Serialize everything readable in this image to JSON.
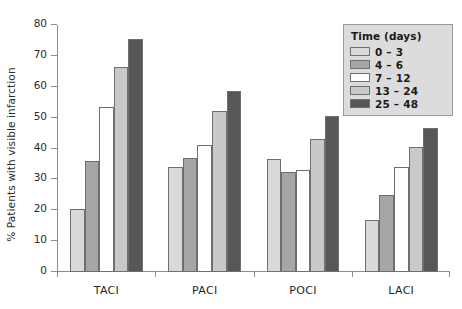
{
  "chart_data": {
    "type": "bar",
    "title": "",
    "xlabel": "",
    "ylabel": "% Patients with visible infarction",
    "ylim": [
      0,
      80
    ],
    "yticks": [
      0,
      10,
      20,
      30,
      40,
      50,
      60,
      70,
      80
    ],
    "ytick_labels": [
      "0",
      "10",
      "20",
      "30",
      "40",
      "50",
      "60",
      "70",
      "80"
    ],
    "grid": false,
    "legend_position": "top-right",
    "legend_title": "Time (days)",
    "categories": [
      "TACI",
      "PACI",
      "POCI",
      "LACI"
    ],
    "series": [
      {
        "name": "0 – 3",
        "color": "#d9d9d9",
        "values": [
          20.5,
          34.0,
          36.5,
          17.0
        ]
      },
      {
        "name": "4 – 6",
        "color": "#a6a6a6",
        "values": [
          36.0,
          37.0,
          32.5,
          25.0
        ]
      },
      {
        "name": "7 – 12",
        "color": "#ffffff",
        "values": [
          53.5,
          41.0,
          33.0,
          34.0
        ]
      },
      {
        "name": "13 – 24",
        "color": "#c9c9c9",
        "values": [
          66.5,
          52.0,
          43.0,
          40.5
        ]
      },
      {
        "name": "25 – 48",
        "color": "#575757",
        "values": [
          75.5,
          58.5,
          50.5,
          46.5
        ]
      }
    ]
  }
}
